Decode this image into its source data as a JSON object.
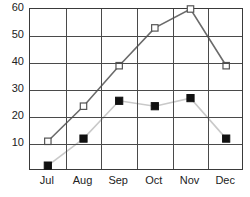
{
  "chart_data": {
    "type": "line",
    "title": "",
    "xlabel": "",
    "ylabel": "",
    "categories": [
      "Jul",
      "Aug",
      "Sep",
      "Oct",
      "Nov",
      "Dec"
    ],
    "ylim": [
      0,
      60
    ],
    "xlim": [
      0,
      6
    ],
    "yticks": [
      10,
      20,
      30,
      40,
      50,
      60
    ],
    "ytick_labels": [
      "10",
      "20",
      "30",
      "40",
      "50",
      "60"
    ],
    "grid": true,
    "grid_orientation": "both",
    "legend": "none",
    "series": [
      {
        "name": "open-square-series",
        "marker": "open-square",
        "marker_fill": "#ffffff",
        "marker_edge": "#555555",
        "line_color": "#6b6b6b",
        "values": [
          11,
          24,
          39,
          53,
          60,
          39
        ]
      },
      {
        "name": "filled-square-series",
        "marker": "filled-square",
        "marker_fill": "#111111",
        "marker_edge": "#111111",
        "line_color": "#c9c9c9",
        "values": [
          2,
          12,
          26,
          24,
          27,
          12
        ]
      }
    ]
  },
  "axes": {
    "frame_color": "#3a3a3a",
    "grid_color": "#4a4a4a",
    "tick_text_color": "#222222"
  }
}
